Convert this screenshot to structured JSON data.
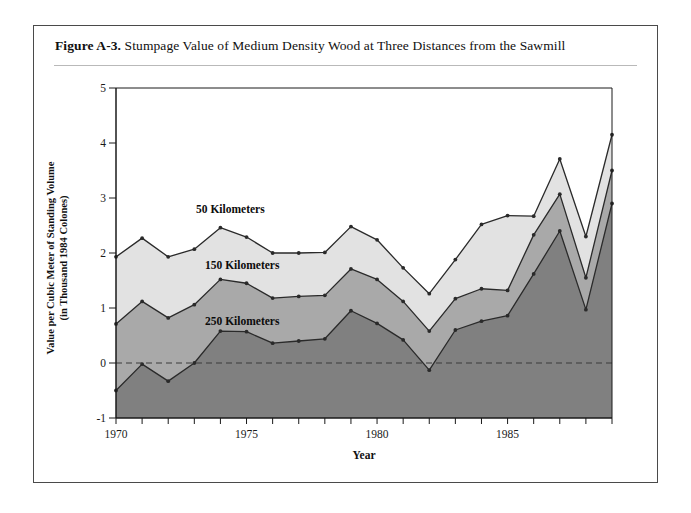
{
  "figure": {
    "label": "Figure A-3.",
    "title": "Stumpage Value of Medium Density Wood at Three Distances from the Sawmill"
  },
  "axes": {
    "y_title_line1": "Value per Cubic Meter of Standing Volume",
    "y_title_line2": "(in Thousand 1984 Colones)",
    "x_title": "Year",
    "y_ticks": [
      "5",
      "4",
      "3",
      "2",
      "1",
      "0",
      "-1"
    ],
    "x_ticks": [
      "1970",
      "1975",
      "1980",
      "1985"
    ]
  },
  "series_labels": {
    "s50": "50 Kilometers",
    "s150": "150 Kilometers",
    "s250": "250 Kilometers"
  },
  "colors": {
    "band_50": "#e2e2e2",
    "band_150": "#a9a9a9",
    "band_250": "#808080",
    "line": "#2a2a2a",
    "axis": "#1a1a1a",
    "frame": "#4a4a4a",
    "zero_line": "#3a3a3a"
  },
  "chart_data": {
    "type": "area",
    "title": "Stumpage Value of Medium Density Wood at Three Distances from the Sawmill",
    "xlabel": "Year",
    "ylabel": "Value per Cubic Meter of Standing Volume (in Thousand 1984 Colones)",
    "xlim": [
      1970,
      1989
    ],
    "ylim": [
      -1,
      5
    ],
    "grid": false,
    "stacked": false,
    "legend_position": "inline-annotations",
    "x": [
      1970,
      1971,
      1972,
      1973,
      1974,
      1975,
      1976,
      1977,
      1978,
      1979,
      1980,
      1981,
      1982,
      1983,
      1984,
      1985,
      1986,
      1987,
      1988,
      1989
    ],
    "series": [
      {
        "name": "50 Kilometers",
        "fill": "#e2e2e2",
        "values": [
          1.93,
          2.27,
          1.93,
          2.07,
          2.46,
          2.29,
          2.0,
          2.0,
          2.01,
          2.48,
          2.24,
          1.73,
          1.26,
          1.88,
          2.52,
          2.68,
          2.67,
          3.71,
          2.3,
          4.15
        ]
      },
      {
        "name": "150 Kilometers",
        "fill": "#a9a9a9",
        "values": [
          0.71,
          1.12,
          0.82,
          1.06,
          1.52,
          1.45,
          1.18,
          1.21,
          1.23,
          1.71,
          1.52,
          1.12,
          0.58,
          1.17,
          1.35,
          1.32,
          2.33,
          3.07,
          1.55,
          3.5
        ]
      },
      {
        "name": "250 Kilometers",
        "fill": "#808080",
        "values": [
          -0.5,
          -0.02,
          -0.33,
          0.0,
          0.58,
          0.57,
          0.36,
          0.4,
          0.44,
          0.95,
          0.72,
          0.42,
          -0.13,
          0.6,
          0.76,
          0.86,
          1.62,
          2.4,
          0.97,
          2.9
        ]
      }
    ]
  }
}
